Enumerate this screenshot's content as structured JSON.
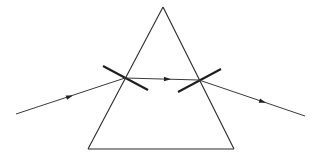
{
  "diagram": {
    "type": "prism-refraction",
    "colors": {
      "background": "#ffffff",
      "prism": "#2a2a2a",
      "ray": "#3a3a3a",
      "normal": "#1e1e1e"
    },
    "prism": {
      "apex": [
        163,
        7
      ],
      "base_left": [
        88,
        149
      ],
      "base_right": [
        234,
        149
      ]
    },
    "rays": {
      "incident": {
        "from": [
          16,
          114
        ],
        "to": [
          125,
          78
        ],
        "arrow_at": [
          70,
          96
        ]
      },
      "internal": {
        "from": [
          125,
          78
        ],
        "to": [
          199,
          80
        ],
        "arrow_at": [
          169,
          79
        ]
      },
      "emergent": {
        "from": [
          199,
          80
        ],
        "to": [
          305,
          116
        ],
        "arrow_at": [
          264,
          101
        ]
      }
    },
    "normals": [
      {
        "name": "entry-normal",
        "from": [
          103,
          66
        ],
        "to": [
          148,
          90
        ]
      },
      {
        "name": "exit-normal",
        "from": [
          178,
          92
        ],
        "to": [
          221,
          69
        ]
      }
    ]
  }
}
